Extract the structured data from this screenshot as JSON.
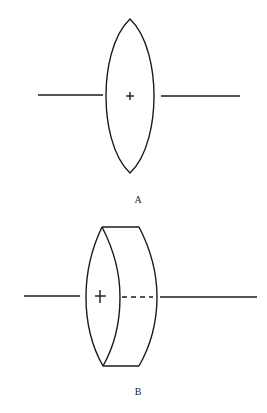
{
  "figures": [
    {
      "id": "A",
      "label": "A",
      "description": "Biconvex lens on optical axis, viewed edge-on"
    },
    {
      "id": "B",
      "label": "B",
      "description": "Biconvex lens on optical axis, viewed in perspective as a thick disc"
    }
  ],
  "colors": {
    "stroke": "#1a1a1a",
    "background": "#ffffff"
  }
}
